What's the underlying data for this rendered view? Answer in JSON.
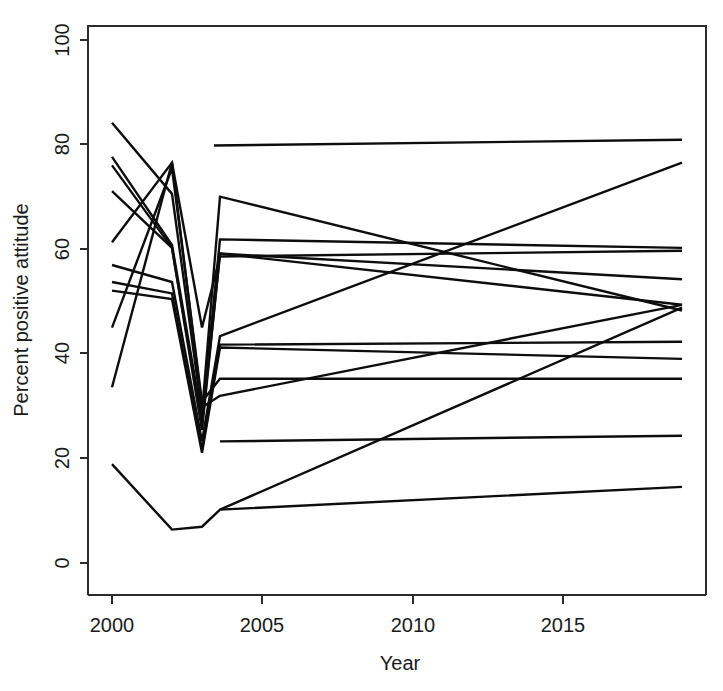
{
  "chart_data": {
    "type": "line",
    "title": "",
    "xlabel": "Year",
    "ylabel": "Percent positive attitude",
    "xlim": [
      1999.2,
      2019.8
    ],
    "ylim": [
      0,
      100
    ],
    "grid": false,
    "legend": null,
    "x_ticks": [
      2000,
      2005,
      2010,
      2015
    ],
    "x_tick_labels": [
      "2000",
      "2005",
      "2010",
      "2015"
    ],
    "y_ticks": [
      0,
      20,
      40,
      60,
      80,
      100
    ],
    "y_tick_labels": [
      "0",
      "20",
      "40",
      "60",
      "80",
      "100"
    ],
    "line_color": "#0d0d0d",
    "series": [
      {
        "name": "line-01",
        "x": [
          2000,
          2002,
          2003,
          2003.6,
          2019
        ],
        "values": [
          83,
          70.5,
          32,
          70,
          50
        ]
      },
      {
        "name": "line-02",
        "x": [
          2000,
          2002,
          2003,
          2003.6,
          2019
        ],
        "values": [
          77,
          61.5,
          31,
          62.5,
          61
        ]
      },
      {
        "name": "line-03",
        "x": [
          2000,
          2002,
          2003,
          2003.6,
          2019
        ],
        "values": [
          75.5,
          61,
          30,
          60,
          55.5
        ]
      },
      {
        "name": "line-04",
        "x": [
          2000,
          2002,
          2003,
          2003.6,
          2019
        ],
        "values": [
          71,
          61,
          29,
          60,
          51
        ]
      },
      {
        "name": "line-05",
        "x": [
          2000,
          2002,
          2003,
          2003.6,
          2019
        ],
        "values": [
          62,
          76,
          47,
          59.5,
          60.5
        ]
      },
      {
        "name": "line-06",
        "x": [
          2000,
          2002,
          2003,
          2003.6,
          2019
        ],
        "values": [
          58,
          55,
          27,
          45.5,
          76
        ]
      },
      {
        "name": "line-07",
        "x": [
          2000,
          2002,
          2003,
          2003.6,
          2019
        ],
        "values": [
          55,
          53,
          25.5,
          44,
          44.5
        ]
      },
      {
        "name": "line-08",
        "x": [
          2000,
          2002,
          2003,
          2003.6,
          2019
        ],
        "values": [
          53.5,
          52,
          25,
          43.5,
          41.5
        ]
      },
      {
        "name": "line-09",
        "x": [
          2000,
          2002,
          2003,
          2003.6,
          2019
        ],
        "values": [
          47,
          75,
          34,
          38,
          38
        ]
      },
      {
        "name": "line-10",
        "x": [
          2000,
          2002,
          2003,
          2003.6,
          2019
        ],
        "values": [
          36.5,
          76,
          33,
          35,
          51
        ]
      },
      {
        "name": "line-11",
        "x": [
          2000,
          2002,
          2003,
          2003.6,
          2019
        ],
        "values": [
          23,
          11.5,
          12,
          15,
          19
        ]
      },
      {
        "name": "line-12",
        "x": [
          2003.4,
          2019
        ],
        "values": [
          79,
          80
        ]
      },
      {
        "name": "line-13",
        "x": [
          2003.6,
          2019
        ],
        "values": [
          27,
          28
        ]
      },
      {
        "name": "line-14",
        "x": [
          2003.6,
          2019
        ],
        "values": [
          15,
          50.5
        ]
      }
    ]
  },
  "axes": {
    "x_title": "Year",
    "y_title": "Percent positive attitude"
  },
  "ticks": {
    "x": [
      "2000",
      "2005",
      "2010",
      "2015"
    ],
    "y": [
      "0",
      "20",
      "40",
      "60",
      "80",
      "100"
    ]
  }
}
